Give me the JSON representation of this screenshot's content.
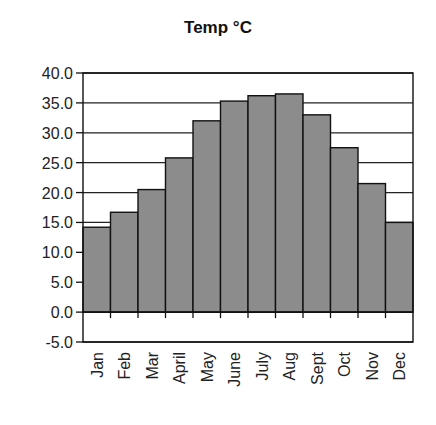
{
  "chart_data": {
    "type": "bar",
    "title": "Temp °C",
    "xlabel": "",
    "ylabel": "",
    "categories": [
      "Jan",
      "Feb",
      "Mar",
      "April",
      "May",
      "June",
      "July",
      "Aug",
      "Sept",
      "Oct",
      "Nov",
      "Dec"
    ],
    "values": [
      14.2,
      16.7,
      20.5,
      25.8,
      32.0,
      35.3,
      36.2,
      36.5,
      33.0,
      27.5,
      21.5,
      15.0
    ],
    "ylim": [
      -5.0,
      40.0
    ],
    "yticks": [
      "-5.0",
      "0.0",
      "5.0",
      "10.0",
      "15.0",
      "20.0",
      "25.0",
      "30.0",
      "35.0",
      "40.0"
    ],
    "ytick_values": [
      -5,
      0,
      5,
      10,
      15,
      20,
      25,
      30,
      35,
      40
    ],
    "grid": true,
    "legend": "none",
    "colors": {
      "bar_fill": "#8c8c8c",
      "bar_stroke": "#111111",
      "grid": "#222222",
      "axis": "#111111"
    }
  }
}
